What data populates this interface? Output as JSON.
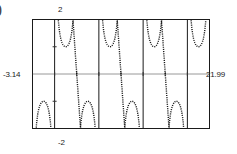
{
  "figure": {
    "enumeration_mark": ")",
    "labels": {
      "y_max": "2",
      "y_min": "-2",
      "x_min": "-3.14",
      "x_max": "21.99"
    }
  },
  "chart_data": {
    "type": "line",
    "title": "",
    "xlabel": "",
    "ylabel": "",
    "xlim": [
      -3.14,
      21.99
    ],
    "ylim": [
      -2,
      2
    ],
    "grid": false,
    "frame": true,
    "axis_style": "dotted",
    "curve_style": "dotted",
    "function": "csc(x)",
    "x_tick_labels": [
      "-3.14",
      "21.99"
    ],
    "y_tick_labels": [
      "-2",
      "2"
    ],
    "asymptotes_x": [
      0,
      6.2832,
      12.5664,
      18.8496
    ],
    "x_axis_y": 0,
    "branches": [
      {
        "name": "branch-upper-left",
        "orientation": "up",
        "x_range": [
          -3.14,
          0
        ],
        "vertex": [
          -1.5708,
          1
        ],
        "clipped_at_y": 2
      },
      {
        "name": "branch-lower-1",
        "orientation": "down",
        "x_range": [
          0,
          6.2832
        ],
        "vertex": [
          3.1416,
          -1
        ],
        "clipped_at_y": -2
      },
      {
        "name": "branch-upper-2",
        "orientation": "up",
        "x_range": [
          6.2832,
          12.5664
        ],
        "vertex": [
          9.4248,
          1
        ],
        "clipped_at_y": 2
      },
      {
        "name": "branch-lower-2",
        "orientation": "down",
        "x_range": [
          12.5664,
          18.8496
        ],
        "vertex": [
          15.708,
          -1
        ],
        "clipped_at_y": -2
      },
      {
        "name": "branch-upper-3",
        "orientation": "up",
        "x_range": [
          18.8496,
          21.99
        ],
        "vertex": [
          21.99,
          2
        ],
        "clipped_at_y": 2
      }
    ],
    "colors": {
      "curve": "#1a1a1a",
      "frame": "#1a1a1a",
      "axis": "#333333",
      "background": "#ffffff"
    }
  }
}
